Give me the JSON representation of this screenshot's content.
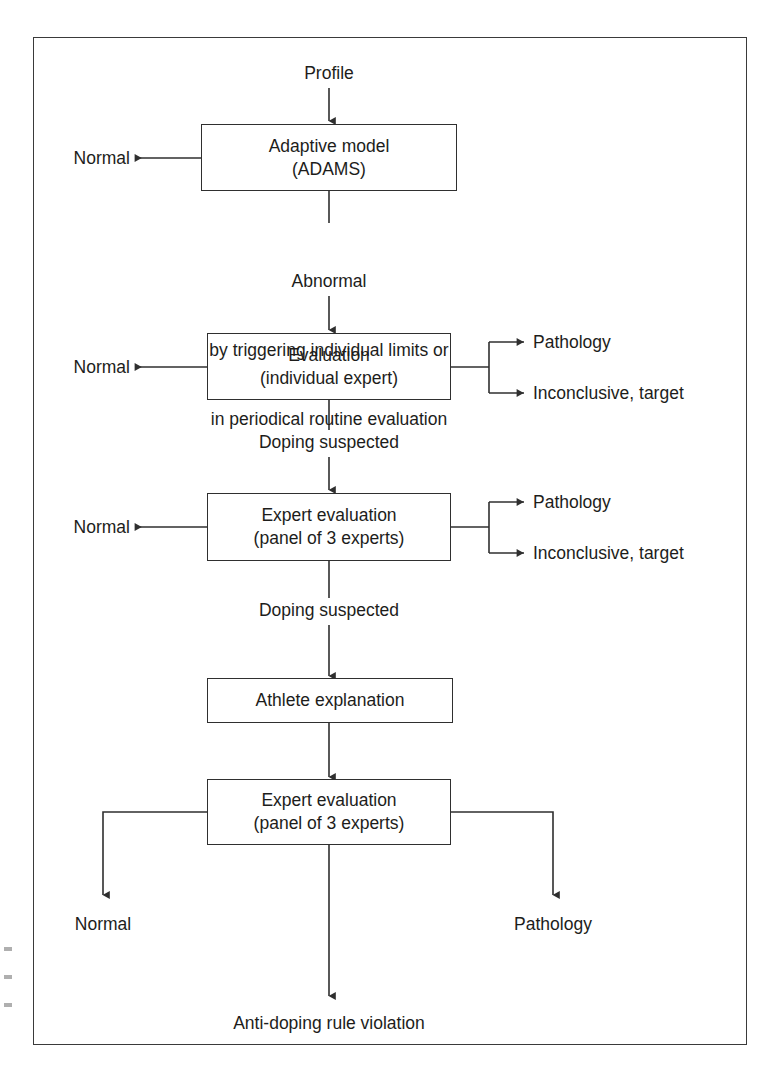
{
  "figure": {
    "type": "flowchart",
    "orientation": "top-to-bottom",
    "title_visible": false,
    "border_color": "#3a3a3a",
    "line_color": "#2f2f2f",
    "text_color": "#1d1d1b"
  },
  "nodes": {
    "start": {
      "id": "profile",
      "label": "Profile",
      "shape": "text"
    },
    "adaptive_model": {
      "id": "adaptive-model",
      "line1": "Adaptive model",
      "line2": "(ADAMS)",
      "shape": "rectangle"
    },
    "evaluation_individual": {
      "id": "evaluation-individual-expert",
      "line1": "Evaluation",
      "line2": "(individual expert)",
      "shape": "rectangle"
    },
    "expert_panel_1": {
      "id": "expert-evaluation-panel-1",
      "line1": "Expert evaluation",
      "line2": "(panel of 3 experts)",
      "shape": "rectangle"
    },
    "athlete_explanation": {
      "id": "athlete-explanation",
      "line1": "Athlete explanation",
      "shape": "rectangle"
    },
    "expert_panel_2": {
      "id": "expert-evaluation-panel-2",
      "line1": "Expert evaluation",
      "line2": "(panel of 3 experts)",
      "shape": "rectangle"
    }
  },
  "edge_labels": {
    "abnormal_line1": "Abnormal",
    "abnormal_line2": "by triggering individual limits or",
    "abnormal_line3": "in periodical routine evaluation",
    "doping_suspected_1": "Doping suspected",
    "doping_suspected_2": "Doping suspected"
  },
  "outcomes": {
    "normal_from_adaptive": "Normal",
    "normal_from_evaluation": "Normal",
    "normal_from_expert_panel_1": "Normal",
    "pathology_from_evaluation": "Pathology",
    "inconclusive_from_evaluation": "Inconclusive, target",
    "pathology_from_expert_panel_1": "Pathology",
    "inconclusive_from_expert_panel_1": "Inconclusive, target",
    "normal_final": "Normal",
    "pathology_final": "Pathology",
    "violation_final": "Anti-doping rule violation"
  },
  "flow_sequence": [
    "Profile",
    "Adaptive model (ADAMS)",
    "Evaluation (individual expert)",
    "Expert evaluation (panel of 3 experts)",
    "Athlete explanation",
    "Expert evaluation (panel of 3 experts)",
    "Anti-doping rule violation"
  ]
}
